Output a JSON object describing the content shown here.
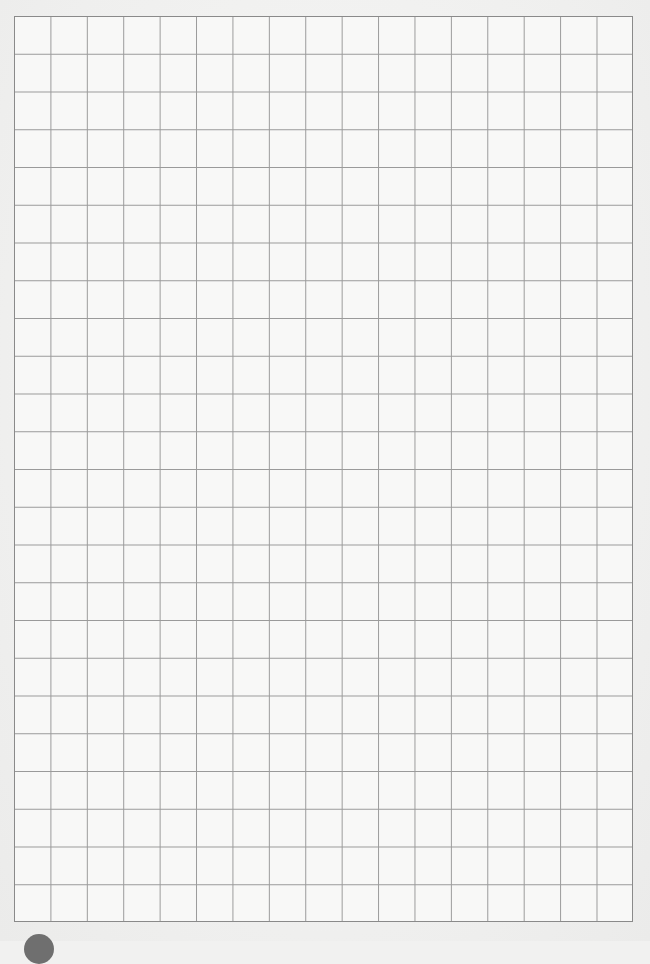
{
  "page": {
    "type": "grid-paper",
    "grid": {
      "columns": 17,
      "rows": 24,
      "line_color": "#9a9a9a",
      "border_color": "#8a8a8a",
      "paper_color": "#f8f8f7"
    },
    "corner_mark_color": "#6f6f6f"
  }
}
